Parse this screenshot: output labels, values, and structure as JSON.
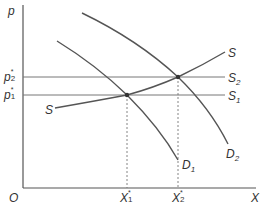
{
  "diagram": {
    "type": "supply-demand",
    "colors": {
      "axis": "#555555",
      "curve": "#555555",
      "guide": "#777777",
      "point": "#333333",
      "text": "#333333"
    },
    "axes": {
      "y_label": "p",
      "x_label": "X",
      "origin_label": "O"
    },
    "price_levels": [
      {
        "name": "p2",
        "base": "p",
        "sub": "2",
        "sup": "*",
        "line_label": "S",
        "line_sub": "2"
      },
      {
        "name": "p1",
        "base": "p",
        "sub": "1",
        "sup": "*",
        "line_label": "S",
        "line_sub": "1"
      }
    ],
    "quantity_levels": [
      {
        "name": "X1",
        "base": "X",
        "sub": "1",
        "sup": "*"
      },
      {
        "name": "X2",
        "base": "X",
        "sub": "2",
        "sup": "*"
      }
    ],
    "curves": {
      "supply": {
        "label_right": "S",
        "label_left": "S"
      },
      "demand1": {
        "base": "D",
        "sub": "1"
      },
      "demand2": {
        "base": "D",
        "sub": "2"
      }
    },
    "equilibria": [
      {
        "name": "E1",
        "price": "p1*",
        "quantity": "X1*"
      },
      {
        "name": "E2",
        "price": "p2*",
        "quantity": "X2*"
      }
    ]
  }
}
